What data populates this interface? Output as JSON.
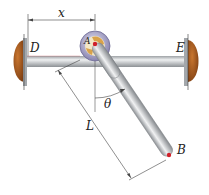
{
  "figure": {
    "type": "mechanics-diagram",
    "labels": {
      "shaft_left_end": "D",
      "shaft_right_end": "E",
      "collar": "A",
      "rod_end": "B",
      "position": "x",
      "length": "L",
      "angle": "θ"
    },
    "colors": {
      "shaft": "#b8bcc0",
      "rod": "#c4c7ca",
      "end_cap": "#a0561f",
      "collar_ring": "#8a86b8",
      "collar_inner": "#d9a24a",
      "pin": "#d0202a",
      "dimension_line": "#333333"
    }
  }
}
